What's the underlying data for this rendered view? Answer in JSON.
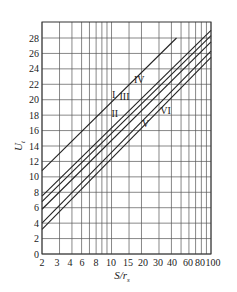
{
  "chart_data": {
    "type": "line",
    "title": "",
    "xlabel": "S/r_s",
    "xlabel_main": "S/r",
    "xlabel_sub": "s",
    "ylabel_main": "U",
    "ylabel_sub": "t",
    "xscale": "log",
    "xlim": [
      2,
      100
    ],
    "ylim": [
      0,
      30
    ],
    "grid": true,
    "x_tick_labels": [
      "2",
      "3",
      "4",
      "6",
      "8",
      "10",
      "15",
      "20",
      "30",
      "40",
      "60",
      "80",
      "100"
    ],
    "x_tick_label_px": [
      42,
      57,
      70,
      82,
      96,
      111,
      128,
      143,
      158,
      172,
      188,
      200,
      213
    ],
    "x_gridlines": [
      2,
      3,
      4,
      5,
      6,
      7,
      8,
      9,
      10,
      15,
      20,
      30,
      40,
      50,
      60,
      70,
      80,
      90,
      100
    ],
    "y_ticks": [
      0,
      2,
      4,
      6,
      8,
      10,
      12,
      14,
      16,
      18,
      20,
      22,
      24,
      26,
      28
    ],
    "series": [
      {
        "name": "I",
        "x": [
          2,
          45
        ],
        "y": [
          10.8,
          28.0
        ],
        "label_at": [
          10.5,
          20.2
        ]
      },
      {
        "name": "II",
        "x": [
          2,
          100
        ],
        "y": [
          7.5,
          29.0
        ],
        "label_at": [
          10.8,
          17.8
        ]
      },
      {
        "name": "III",
        "x": [
          2,
          100
        ],
        "y": [
          6.8,
          28.3
        ],
        "label_at": [
          13.5,
          20.0
        ]
      },
      {
        "name": "IV",
        "x": [
          2,
          100
        ],
        "y": [
          5.8,
          27.5
        ],
        "label_at": [
          19.0,
          22.2
        ]
      },
      {
        "name": "V",
        "x": [
          2,
          100
        ],
        "y": [
          4.0,
          26.3
        ],
        "label_at": [
          22.0,
          16.5
        ]
      },
      {
        "name": "VI",
        "x": [
          2,
          100
        ],
        "y": [
          3.2,
          25.5
        ],
        "label_at": [
          35.0,
          18.2
        ]
      }
    ]
  }
}
